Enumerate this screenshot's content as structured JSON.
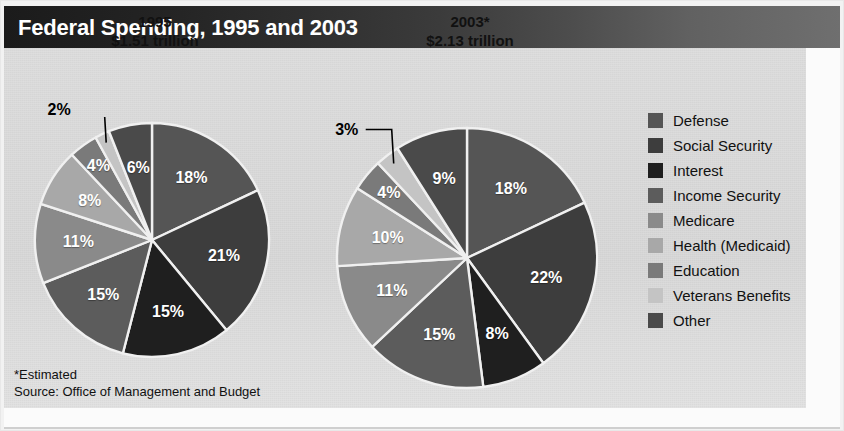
{
  "header": {
    "title": "Federal Spending, 1995 and 2003"
  },
  "footnotes": {
    "estimated_note": "*Estimated",
    "source_note": "Source:  Office of Management and Budget"
  },
  "legend": {
    "items": [
      {
        "label": "Defense",
        "color": "#555555"
      },
      {
        "label": "Social Security",
        "color": "#3d3d3d"
      },
      {
        "label": "Interest",
        "color": "#1f1f1f"
      },
      {
        "label": "Income Security",
        "color": "#5c5c5c"
      },
      {
        "label": "Medicare",
        "color": "#8a8a8a"
      },
      {
        "label": "Health (Medicaid)",
        "color": "#a8a8a8"
      },
      {
        "label": "Education",
        "color": "#7a7a7a"
      },
      {
        "label": "Veterans Benefits",
        "color": "#c4c4c4"
      },
      {
        "label": "Other",
        "color": "#4a4a4a"
      }
    ]
  },
  "chart_data": [
    {
      "type": "pie",
      "title": "1995",
      "subtitle": "$1.51 trillion",
      "total_label": "$1.51 trillion",
      "categories": [
        "Defense",
        "Social Security",
        "Interest",
        "Income Security",
        "Medicare",
        "Health (Medicaid)",
        "Education",
        "Veterans Benefits",
        "Other"
      ],
      "values": [
        18,
        21,
        15,
        15,
        11,
        8,
        4,
        2,
        6
      ],
      "value_labels": [
        "18%",
        "21%",
        "15%",
        "15%",
        "11%",
        "8%",
        "4%",
        "2%",
        "6%"
      ],
      "colors": [
        "#555555",
        "#3d3d3d",
        "#1f1f1f",
        "#5c5c5c",
        "#8a8a8a",
        "#a8a8a8",
        "#7a7a7a",
        "#c4c4c4",
        "#4a4a4a"
      ],
      "callout_slices": [
        "Veterans Benefits"
      ],
      "start_angle_deg": 0,
      "direction": "clockwise",
      "legend_position": "right",
      "grid": false
    },
    {
      "type": "pie",
      "title": "2003*",
      "subtitle": "$2.13 trillion",
      "total_label": "$2.13 trillion",
      "categories": [
        "Defense",
        "Social Security",
        "Interest",
        "Income Security",
        "Medicare",
        "Health (Medicaid)",
        "Education",
        "Veterans Benefits",
        "Other"
      ],
      "values": [
        18,
        22,
        8,
        15,
        11,
        10,
        4,
        3,
        9
      ],
      "value_labels": [
        "18%",
        "22%",
        "8%",
        "15%",
        "11%",
        "10%",
        "4%",
        "3%",
        "9%"
      ],
      "colors": [
        "#555555",
        "#3d3d3d",
        "#1f1f1f",
        "#5c5c5c",
        "#8a8a8a",
        "#a8a8a8",
        "#7a7a7a",
        "#c4c4c4",
        "#4a4a4a"
      ],
      "callout_slices": [
        "Veterans Benefits"
      ],
      "start_angle_deg": 0,
      "direction": "clockwise",
      "legend_position": "right",
      "grid": false
    }
  ],
  "charts_layout": [
    {
      "cx": 152,
      "cy": 240,
      "r": 117,
      "heading_left": 60,
      "heading_top": 12,
      "heading_width": 190
    },
    {
      "cx": 467,
      "cy": 258,
      "r": 130,
      "heading_left": 375,
      "heading_top": 12,
      "heading_width": 190
    }
  ]
}
